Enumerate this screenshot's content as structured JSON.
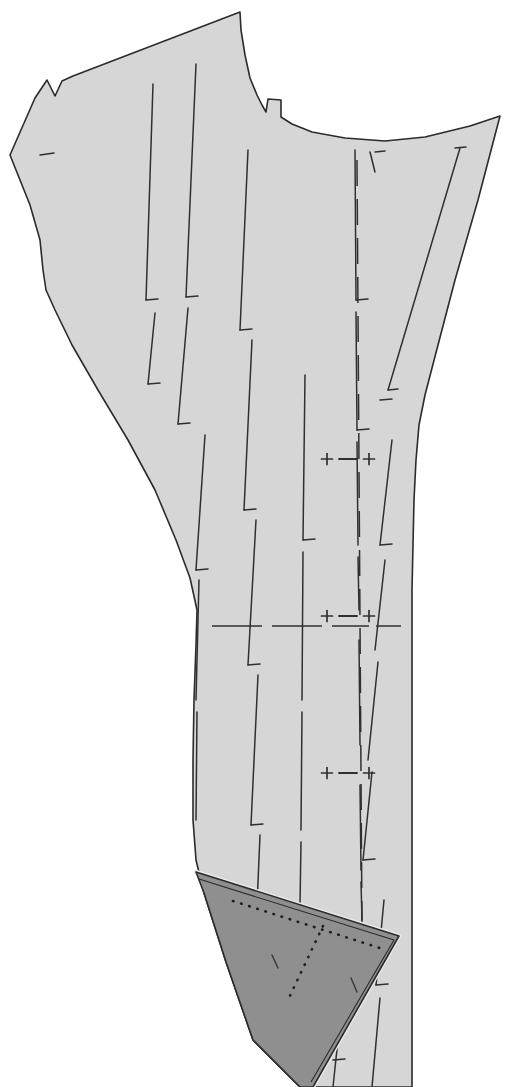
{
  "document": {
    "kind": "sewing-pattern-piece",
    "title": "Trouser Pattern Piece",
    "background_color": "#ffffff",
    "width": 514,
    "height": 1087
  },
  "colors": {
    "body_fill": "#d6d6d6",
    "body_stroke": "#2b2b2b",
    "fold_fill": "#8f8f8f",
    "fold_stroke": "#2b2b2b",
    "fold_edge_highlight": "#e8e8e8",
    "marking_stroke": "#2f2f2f",
    "dotted_stroke": "#1f1f1f"
  },
  "shapes": {
    "body_outline": "M 10,155 L 35,98 L 47,80 L 55,96 L 62,81 L 73,76 L 240,12 L 241,30 L 245,55 L 250,78 L 257,95 L 262,105 L 266,112 L 268,99 L 281,100 L 281,117 L 292,124 L 312,132 L 345,138 L 385,141 L 425,137 L 470,126 L 500,116 L 478,200 L 455,280 L 438,345 L 425,395 L 419,425 L 416,460 L 414,500 L 413,545 L 412,590 L 412,640 L 412,700 L 412,770 L 412,840 L 412,920 L 412,1000 L 412,1087 L 300,1087 L 253,1040 L 226,962 L 204,893 L 196,860 L 193,820 L 193,760 L 194,700 L 196,645 L 197,610 L 190,578 L 176,540 L 155,490 L 128,440 L 98,390 L 72,345 L 55,310 L 46,290 L 43,270 L 40,240 L 30,205 L 18,175 Z",
    "fold_triangle": "M 196,872 L 399,936 L 313,1087 L 300,1087 L 253,1040 L 226,962 L 204,893 Z",
    "fold_highlight": "M 196,872 L 399,936 L 313,1087",
    "fold_inner_line": "M 199,879 L 394,940 L 311,1082"
  },
  "fold_dotted_lines": [
    {
      "name": "fold-dotted-upper",
      "x1": 233,
      "y1": 901,
      "x2": 386,
      "y2": 950
    },
    {
      "name": "fold-dotted-vertical",
      "x1": 323,
      "y1": 926,
      "x2": 288,
      "y2": 1000
    }
  ],
  "grain_lines": [
    {
      "x1": 153,
      "y1": 84,
      "x2": 146,
      "y2": 300
    },
    {
      "x1": 155,
      "y1": 313,
      "x2": 148,
      "y2": 384
    },
    {
      "x1": 196,
      "y1": 64,
      "x2": 186,
      "y2": 297
    },
    {
      "x1": 188,
      "y1": 308,
      "x2": 178,
      "y2": 424
    },
    {
      "x1": 205,
      "y1": 435,
      "x2": 196,
      "y2": 570
    },
    {
      "x1": 199,
      "y1": 580,
      "x2": 196,
      "y2": 700
    },
    {
      "x1": 197,
      "y1": 712,
      "x2": 196,
      "y2": 820
    },
    {
      "x1": 248,
      "y1": 150,
      "x2": 240,
      "y2": 330
    },
    {
      "x1": 252,
      "y1": 340,
      "x2": 244,
      "y2": 510
    },
    {
      "x1": 256,
      "y1": 520,
      "x2": 248,
      "y2": 665
    },
    {
      "x1": 258,
      "y1": 675,
      "x2": 251,
      "y2": 825
    },
    {
      "x1": 260,
      "y1": 835,
      "x2": 253,
      "y2": 1000
    },
    {
      "x1": 263,
      "y1": 1010,
      "x2": 258,
      "y2": 1087
    },
    {
      "x1": 305,
      "y1": 375,
      "x2": 303,
      "y2": 540
    },
    {
      "x1": 303,
      "y1": 552,
      "x2": 302,
      "y2": 700
    },
    {
      "x1": 302,
      "y1": 712,
      "x2": 301,
      "y2": 830
    },
    {
      "x1": 301,
      "y1": 842,
      "x2": 300,
      "y2": 905
    },
    {
      "x1": 355,
      "y1": 150,
      "x2": 356,
      "y2": 300
    },
    {
      "x1": 356,
      "y1": 312,
      "x2": 357,
      "y2": 430
    },
    {
      "x1": 357,
      "y1": 442,
      "x2": 358,
      "y2": 545
    },
    {
      "x1": 358,
      "y1": 557,
      "x2": 359,
      "y2": 610
    },
    {
      "x1": 359,
      "y1": 640,
      "x2": 360,
      "y2": 745
    },
    {
      "x1": 360,
      "y1": 785,
      "x2": 361,
      "y2": 870
    },
    {
      "x1": 361,
      "y1": 882,
      "x2": 362,
      "y2": 920
    },
    {
      "x1": 370,
      "y1": 152,
      "x2": 375,
      "y2": 172
    },
    {
      "x1": 392,
      "y1": 440,
      "x2": 380,
      "y2": 545
    },
    {
      "x1": 385,
      "y1": 560,
      "x2": 375,
      "y2": 650
    },
    {
      "x1": 378,
      "y1": 662,
      "x2": 368,
      "y2": 760
    },
    {
      "x1": 372,
      "y1": 772,
      "x2": 363,
      "y2": 860
    },
    {
      "x1": 384,
      "y1": 900,
      "x2": 376,
      "y2": 985
    },
    {
      "x1": 380,
      "y1": 998,
      "x2": 372,
      "y2": 1087
    },
    {
      "x1": 460,
      "y1": 148,
      "x2": 388,
      "y2": 390
    },
    {
      "x1": 339,
      "y1": 1030,
      "x2": 333,
      "y2": 1087
    },
    {
      "x1": 355,
      "y1": 980,
      "x2": 352,
      "y2": 1005
    }
  ],
  "notch_ticks": [
    {
      "x1": 40,
      "y1": 155,
      "x2": 54,
      "y2": 153
    },
    {
      "x1": 146,
      "y1": 300,
      "x2": 158,
      "y2": 299
    },
    {
      "x1": 148,
      "y1": 384,
      "x2": 160,
      "y2": 383
    },
    {
      "x1": 186,
      "y1": 297,
      "x2": 198,
      "y2": 296
    },
    {
      "x1": 178,
      "y1": 424,
      "x2": 190,
      "y2": 423
    },
    {
      "x1": 196,
      "y1": 570,
      "x2": 208,
      "y2": 569
    },
    {
      "x1": 240,
      "y1": 330,
      "x2": 252,
      "y2": 329
    },
    {
      "x1": 244,
      "y1": 510,
      "x2": 256,
      "y2": 509
    },
    {
      "x1": 248,
      "y1": 665,
      "x2": 260,
      "y2": 664
    },
    {
      "x1": 251,
      "y1": 825,
      "x2": 263,
      "y2": 824
    },
    {
      "x1": 253,
      "y1": 1000,
      "x2": 265,
      "y2": 999
    },
    {
      "x1": 303,
      "y1": 540,
      "x2": 315,
      "y2": 539
    },
    {
      "x1": 356,
      "y1": 300,
      "x2": 368,
      "y2": 299
    },
    {
      "x1": 357,
      "y1": 430,
      "x2": 369,
      "y2": 429
    },
    {
      "x1": 375,
      "y1": 152,
      "x2": 385,
      "y2": 151
    },
    {
      "x1": 380,
      "y1": 400,
      "x2": 392,
      "y2": 399
    },
    {
      "x1": 380,
      "y1": 545,
      "x2": 392,
      "y2": 544
    },
    {
      "x1": 388,
      "y1": 390,
      "x2": 398,
      "y2": 389
    },
    {
      "x1": 455,
      "y1": 148,
      "x2": 466,
      "y2": 147
    },
    {
      "x1": 363,
      "y1": 860,
      "x2": 375,
      "y2": 859
    },
    {
      "x1": 376,
      "y1": 985,
      "x2": 388,
      "y2": 984
    },
    {
      "x1": 333,
      "y1": 1060,
      "x2": 345,
      "y2": 1059
    },
    {
      "x1": 272,
      "y1": 955,
      "x2": 278,
      "y2": 968
    },
    {
      "x1": 351,
      "y1": 978,
      "x2": 357,
      "y2": 992
    }
  ],
  "registration_markers": [
    {
      "name": "registration-marker-upper",
      "cy": 459,
      "left_plus_x": 327,
      "right_plus_x": 369,
      "dash_x1": 339,
      "dash_x2": 357,
      "symbol_left": "+",
      "symbol_dash": "–",
      "symbol_right": "+"
    },
    {
      "name": "registration-marker-middle",
      "cy": 616,
      "left_plus_x": 327,
      "right_plus_x": 369,
      "dash_x1": 339,
      "dash_x2": 357,
      "symbol_left": "+",
      "symbol_dash": "–",
      "symbol_right": "+"
    },
    {
      "name": "registration-marker-lower",
      "cy": 773,
      "left_plus_x": 327,
      "right_plus_x": 369,
      "dash_x1": 339,
      "dash_x2": 357,
      "symbol_left": "+",
      "symbol_dash": "–",
      "symbol_right": "+"
    }
  ],
  "horizontal_balance_line": {
    "name": "horizontal-balance-line",
    "y": 626,
    "segments": [
      {
        "x1": 212,
        "x2": 262
      },
      {
        "x1": 272,
        "x2": 322
      },
      {
        "x1": 332,
        "x2": 369
      },
      {
        "x1": 376,
        "x2": 401
      }
    ]
  },
  "center_dashed_line": {
    "name": "center-front-dashed-line",
    "x_top": 357,
    "y_top": 160,
    "x_bottom": 362,
    "y_bottom": 930,
    "dash_pattern": "26 13"
  }
}
